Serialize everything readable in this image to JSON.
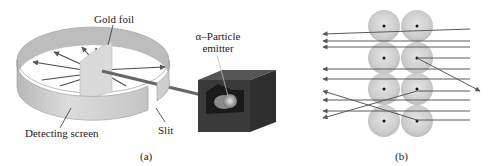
{
  "figure": {
    "panel_a": {
      "caption": "(a)",
      "labels": {
        "gold_foil": "Gold foil",
        "alpha_line1": "α–Particle",
        "alpha_line2": "emitter",
        "detecting_screen": "Detecting screen",
        "slit": "Slit"
      }
    },
    "panel_b": {
      "caption": "(b)",
      "atoms": {
        "columns_x": [
          384,
          417
        ],
        "rows_y": [
          26,
          58,
          89,
          121
        ],
        "radius": 16
      }
    },
    "colors": {
      "ring": "#c9c9c9",
      "ring_dark": "#9e9e9e",
      "foil": "#d6d6d6",
      "box": "#3a3a3a",
      "arrow": "#555555",
      "atom": "#cfcfcf",
      "nucleus": "#111111"
    }
  }
}
